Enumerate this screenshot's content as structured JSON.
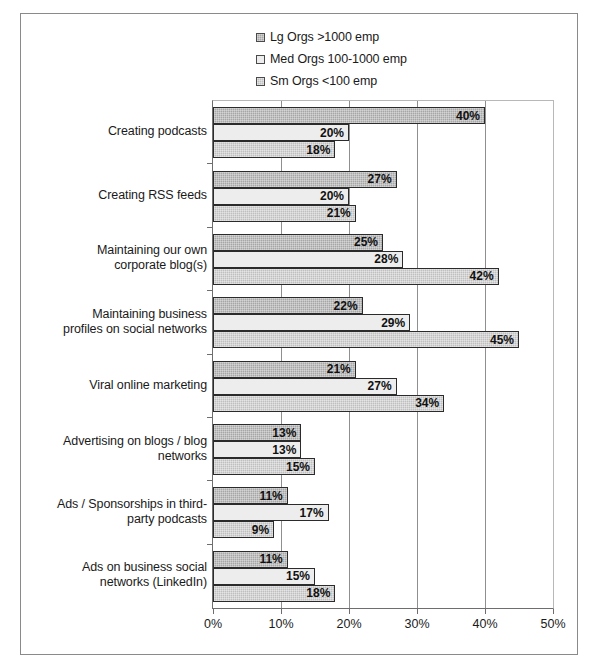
{
  "chart_data": {
    "type": "bar",
    "orientation": "horizontal",
    "title": "",
    "xlabel": "",
    "ylabel": "",
    "xlim": [
      0,
      50
    ],
    "xticks": [
      "0%",
      "10%",
      "20%",
      "30%",
      "40%",
      "50%"
    ],
    "xtick_values": [
      0,
      10,
      20,
      30,
      40,
      50
    ],
    "grid": "vertical",
    "legend_position": "top-center",
    "value_suffix": "%",
    "categories": [
      "Creating podcasts",
      "Creating RSS feeds",
      "Maintaining our own corporate blog(s)",
      "Maintaining business profiles on social networks",
      "Viral online marketing",
      "Advertising on blogs / blog networks",
      "Ads / Sponsorships in third-party podcasts",
      "Ads on business social networks (LinkedIn)"
    ],
    "category_lines": [
      [
        "Creating podcasts"
      ],
      [
        "Creating RSS feeds"
      ],
      [
        "Maintaining our own",
        "corporate blog(s)"
      ],
      [
        "Maintaining business",
        "profiles on social networks"
      ],
      [
        "Viral online marketing"
      ],
      [
        "Advertising on blogs / blog",
        "networks"
      ],
      [
        "Ads / Sponsorships in third-",
        "party podcasts"
      ],
      [
        "Ads on business social",
        "networks (LinkedIn)"
      ]
    ],
    "series": [
      {
        "name": "Lg Orgs >1000 emp",
        "swatch": "fill-lg",
        "color": "#a6a6a6",
        "values": [
          40,
          27,
          25,
          22,
          21,
          13,
          11,
          11
        ],
        "labels": [
          "40%",
          "27%",
          "25%",
          "22%",
          "21%",
          "13%",
          "11%",
          "11%"
        ]
      },
      {
        "name": "Med Orgs 100-1000 emp",
        "swatch": "fill-med",
        "color": "#ededed",
        "values": [
          20,
          20,
          28,
          29,
          27,
          13,
          17,
          15
        ],
        "labels": [
          "20%",
          "20%",
          "28%",
          "29%",
          "27%",
          "13%",
          "17%",
          "15%"
        ]
      },
      {
        "name": "Sm Orgs <100 emp",
        "swatch": "fill-sm",
        "color": "#bfbfbf",
        "values": [
          18,
          21,
          42,
          45,
          34,
          15,
          9,
          18
        ],
        "labels": [
          "18%",
          "21%",
          "42%",
          "45%",
          "34%",
          "15%",
          "9%",
          "18%"
        ]
      }
    ]
  },
  "legend": {
    "items": [
      {
        "label": "Lg Orgs >1000 emp",
        "swatch": "fill-lg"
      },
      {
        "label": "Med Orgs 100-1000 emp",
        "swatch": "fill-med"
      },
      {
        "label": "Sm Orgs <100 emp",
        "swatch": "fill-sm"
      }
    ]
  }
}
